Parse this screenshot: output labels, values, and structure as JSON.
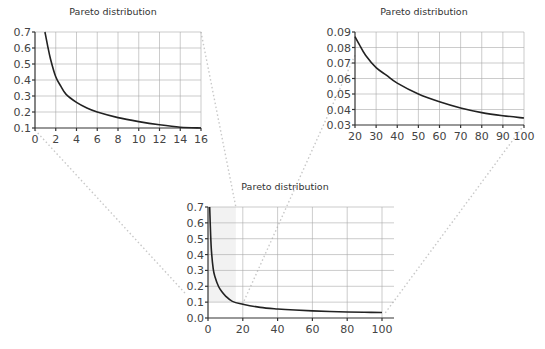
{
  "chart_data": [
    {
      "id": "zoom-left",
      "type": "line",
      "title": "Pareto distribution",
      "xlabel": "",
      "ylabel": "",
      "xlim": [
        0,
        16
      ],
      "ylim": [
        0.1,
        0.7
      ],
      "x_ticks": [
        "0",
        "2",
        "4",
        "6",
        "8",
        "10",
        "12",
        "14",
        "16"
      ],
      "y_ticks": [
        "0.1",
        "0.2",
        "0.3",
        "0.4",
        "0.5",
        "0.6",
        "0.7"
      ],
      "grid": true,
      "x": [
        0.96,
        1.2,
        1.5,
        2,
        2.5,
        3,
        4,
        5,
        6,
        8,
        10,
        12,
        14,
        16
      ],
      "values": [
        0.7,
        0.62,
        0.53,
        0.42,
        0.36,
        0.31,
        0.26,
        0.225,
        0.2,
        0.165,
        0.14,
        0.12,
        0.105,
        0.1
      ]
    },
    {
      "id": "zoom-right",
      "type": "line",
      "title": "Pareto distribution",
      "xlabel": "",
      "ylabel": "",
      "xlim": [
        20,
        100
      ],
      "ylim": [
        0.03,
        0.09
      ],
      "x_ticks": [
        "20",
        "30",
        "40",
        "50",
        "60",
        "70",
        "80",
        "90",
        "100"
      ],
      "y_ticks": [
        "0.03",
        "0.04",
        "0.05",
        "0.06",
        "0.07",
        "0.08",
        "0.09"
      ],
      "grid": true,
      "x": [
        20,
        22,
        25,
        30,
        35,
        40,
        50,
        60,
        70,
        80,
        90,
        100
      ],
      "values": [
        0.087,
        0.082,
        0.075,
        0.067,
        0.062,
        0.057,
        0.05,
        0.045,
        0.041,
        0.038,
        0.036,
        0.0345
      ]
    },
    {
      "id": "overview",
      "type": "line",
      "title": "Pareto distribution",
      "xlabel": "",
      "ylabel": "",
      "xlim": [
        0,
        100
      ],
      "ylim": [
        0.0,
        0.7
      ],
      "x_ticks": [
        "0",
        "20",
        "40",
        "60",
        "80",
        "100"
      ],
      "y_ticks": [
        "0.0",
        "0.1",
        "0.2",
        "0.3",
        "0.4",
        "0.5",
        "0.6",
        "0.7"
      ],
      "grid": true,
      "x": [
        0.96,
        1.5,
        2,
        3,
        4,
        6,
        8,
        10,
        14,
        20,
        30,
        40,
        50,
        60,
        70,
        80,
        90,
        100
      ],
      "values": [
        0.7,
        0.53,
        0.42,
        0.31,
        0.26,
        0.2,
        0.165,
        0.14,
        0.105,
        0.087,
        0.067,
        0.057,
        0.05,
        0.045,
        0.041,
        0.038,
        0.036,
        0.0345
      ]
    }
  ]
}
